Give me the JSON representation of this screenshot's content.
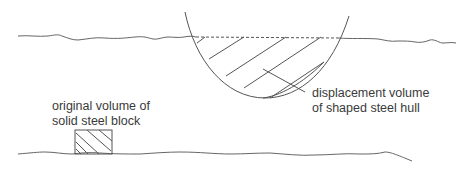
{
  "labels": {
    "hull_line1": "displacement volume",
    "hull_line2": "of shaped steel hull",
    "block_line1": "original volume of",
    "block_line2": "solid steel block"
  },
  "colors": {
    "stroke": "#555555",
    "text": "#3a3a3a"
  }
}
